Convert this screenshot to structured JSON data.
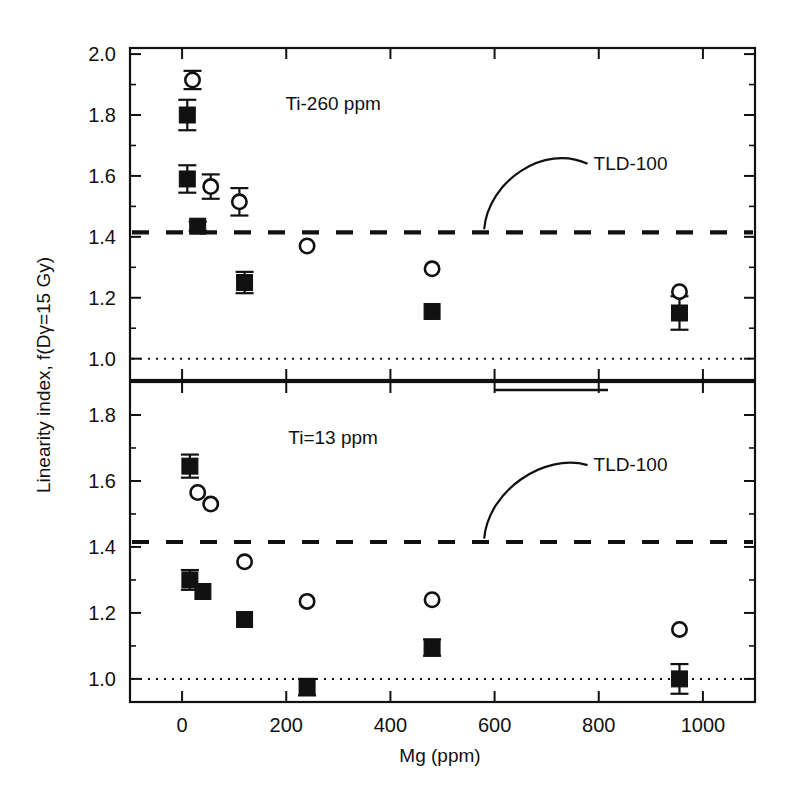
{
  "figure": {
    "ylabel": "Linearity index, f(Dγ=15 Gy)",
    "xlabel": "Mg (ppm)"
  },
  "chart_data": {
    "type": "scatter",
    "title": "",
    "xlabel": "Mg (ppm)",
    "ylabel": "Linearity index, f(Dγ=15 Gy)",
    "xlim": [
      -100,
      1100
    ],
    "xticks": [
      0,
      200,
      400,
      600,
      800,
      1000
    ],
    "xticklabels": [
      "0",
      "200",
      "400",
      "600",
      "800",
      "1000"
    ],
    "grid": false,
    "legend": "none",
    "panels": [
      {
        "id": "top",
        "annotation": "Ti-260 ppm",
        "annotation_x": 290,
        "ylim": [
          0.93,
          2.02
        ],
        "yticks": [
          1.0,
          1.2,
          1.4,
          1.6,
          1.8,
          2.0
        ],
        "yticklabels": [
          "1.0",
          "1.2",
          "1.4",
          "1.6",
          "1.8",
          "2.0"
        ],
        "minor_yticks": [
          1.1,
          1.3,
          1.5,
          1.7,
          1.9
        ],
        "reference_lines": [
          {
            "name": "TLD-100",
            "y": 1.415,
            "style": "dashed",
            "label": "TLD-100"
          },
          {
            "name": "unity",
            "y": 1.0,
            "style": "dotted",
            "label": ""
          }
        ],
        "annotation_leader": {
          "label": "TLD-100",
          "label_x": 790,
          "label_y": 1.62,
          "tip_x": 580,
          "tip_y": 1.425
        },
        "series": [
          {
            "name": "filled-squares",
            "marker": "filled-square",
            "points": [
              {
                "x": 10,
                "y": 1.8,
                "yerr": 0.05
              },
              {
                "x": 10,
                "y": 1.59,
                "yerr": 0.045
              },
              {
                "x": 30,
                "y": 1.435,
                "yerr": 0.015
              },
              {
                "x": 120,
                "y": 1.25,
                "yerr": 0.035
              },
              {
                "x": 480,
                "y": 1.155,
                "yerr": 0.0
              },
              {
                "x": 955,
                "y": 1.15,
                "yerr": 0.055
              }
            ]
          },
          {
            "name": "open-circles",
            "marker": "open-circle",
            "points": [
              {
                "x": 20,
                "y": 1.915,
                "yerr": 0.03
              },
              {
                "x": 55,
                "y": 1.565,
                "yerr": 0.04
              },
              {
                "x": 110,
                "y": 1.515,
                "yerr": 0.045
              },
              {
                "x": 240,
                "y": 1.37,
                "yerr": 0.0
              },
              {
                "x": 480,
                "y": 1.295,
                "yerr": 0.0
              },
              {
                "x": 955,
                "y": 1.22,
                "yerr": 0.0
              }
            ]
          }
        ]
      },
      {
        "id": "bottom",
        "annotation": "Ti=13 ppm",
        "annotation_x": 290,
        "ylim": [
          0.93,
          1.9
        ],
        "yticks": [
          1.0,
          1.2,
          1.4,
          1.6,
          1.8
        ],
        "yticklabels": [
          "1.0",
          "1.2",
          "1.4",
          "1.6",
          "1.8"
        ],
        "minor_yticks": [
          1.1,
          1.3,
          1.5,
          1.7
        ],
        "reference_lines": [
          {
            "name": "TLD-100",
            "y": 1.415,
            "style": "dashed",
            "label": "TLD-100"
          },
          {
            "name": "unity",
            "y": 1.0,
            "style": "dotted",
            "label": ""
          }
        ],
        "annotation_leader": {
          "label": "TLD-100",
          "label_x": 790,
          "label_y": 1.63,
          "tip_x": 580,
          "tip_y": 1.425
        },
        "series": [
          {
            "name": "filled-squares",
            "marker": "filled-square",
            "points": [
              {
                "x": 15,
                "y": 1.645,
                "yerr": 0.035
              },
              {
                "x": 15,
                "y": 1.3,
                "yerr": 0.03
              },
              {
                "x": 40,
                "y": 1.265,
                "yerr": 0.0
              },
              {
                "x": 120,
                "y": 1.18,
                "yerr": 0.0
              },
              {
                "x": 240,
                "y": 0.975,
                "yerr": 0.025
              },
              {
                "x": 480,
                "y": 1.095,
                "yerr": 0.025
              },
              {
                "x": 955,
                "y": 1.0,
                "yerr": 0.045
              }
            ]
          },
          {
            "name": "open-circles",
            "marker": "open-circle",
            "points": [
              {
                "x": 30,
                "y": 1.565,
                "yerr": 0.0
              },
              {
                "x": 55,
                "y": 1.53,
                "yerr": 0.0
              },
              {
                "x": 120,
                "y": 1.355,
                "yerr": 0.0
              },
              {
                "x": 240,
                "y": 1.235,
                "yerr": 0.0
              },
              {
                "x": 480,
                "y": 1.24,
                "yerr": 0.0
              },
              {
                "x": 955,
                "y": 1.15,
                "yerr": 0.0
              }
            ]
          }
        ]
      }
    ]
  }
}
